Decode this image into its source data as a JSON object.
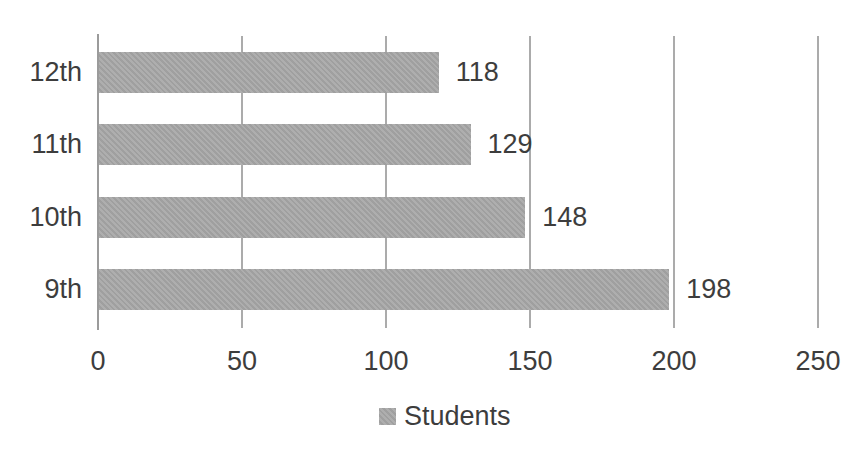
{
  "chart_data": {
    "type": "bar",
    "orientation": "horizontal",
    "title": "",
    "xlabel": "",
    "ylabel": "",
    "categories": [
      "12th",
      "11th",
      "10th",
      "9th"
    ],
    "series": [
      {
        "name": "Students",
        "values": [
          118,
          129,
          148,
          198
        ]
      }
    ],
    "data_labels": [
      "118",
      "129",
      "148",
      "198"
    ],
    "x_ticks": [
      "0",
      "50",
      "100",
      "150",
      "200",
      "250"
    ],
    "xlim": [
      0,
      250
    ],
    "grid": "vertical-gridlines-on",
    "legend_position": "bottom-center",
    "colors": {
      "bar_fill": "#a8a8a8",
      "legend_swatch": "#a8a8a8",
      "text": "#3d3d3d",
      "gridline": "#ababab",
      "axis_line": "#9b9b9b",
      "background": "#ffffff"
    }
  }
}
